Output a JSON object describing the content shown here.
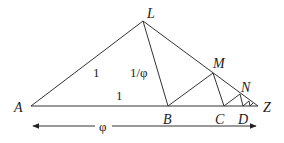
{
  "diagram": {
    "title": "",
    "points": {
      "A": {
        "label": "A",
        "x": 31,
        "y": 106
      },
      "L": {
        "label": "L",
        "x": 143,
        "y": 21
      },
      "B": {
        "label": "B",
        "x": 168,
        "y": 106
      },
      "M": {
        "label": "M",
        "x": 213,
        "y": 73
      },
      "C": {
        "label": "C",
        "x": 224,
        "y": 106
      },
      "N": {
        "label": "N",
        "x": 240,
        "y": 93
      },
      "D": {
        "label": "D",
        "x": 243,
        "y": 106
      },
      "Z": {
        "label": "Z",
        "x": 258,
        "y": 106
      }
    },
    "edge_labels": {
      "AL": "1",
      "LB": "1/φ",
      "AB": "1",
      "AZ": "φ"
    },
    "colors": {
      "stroke": "#333333",
      "text": "#222222",
      "background": "#ffffff"
    }
  }
}
